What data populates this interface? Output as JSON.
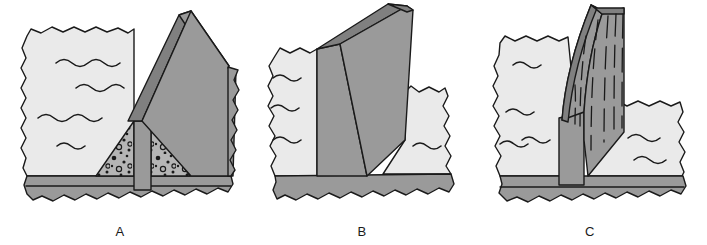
{
  "figure": {
    "background_color": "#ffffff",
    "width": 707,
    "height": 245
  },
  "palette": {
    "outline": "#1a1a1a",
    "light_rock": "#eaeaea",
    "medium_gray": "#9a9a9a",
    "dark_gray": "#808080",
    "basement_gray": "#9a9a9a",
    "stipple_fill": "#b5b5b5",
    "stipple_clast": "#1a1a1a",
    "white": "#ffffff"
  },
  "panels": [
    {
      "id": "A",
      "label": "A",
      "caption": "Fault scarp with wedge of talus and colluvial debris banked against the exposed fault plane",
      "features": [
        {
          "name": "light-bedded-rock-block",
          "fill": "#eaeaea",
          "symbol": "wavy-bedding-lines",
          "line_count": 4
        },
        {
          "name": "fault-plane-face",
          "fill": "#808080"
        },
        {
          "name": "uplifted-block-top",
          "fill": "#9a9a9a"
        },
        {
          "name": "uplifted-block-side",
          "fill": "#9a9a9a"
        },
        {
          "name": "talus-wedge-left",
          "fill": "#b5b5b5",
          "texture": "stippled-clasts"
        },
        {
          "name": "talus-wedge-right",
          "fill": "#b5b5b5",
          "texture": "stippled-clasts"
        },
        {
          "name": "central-pillar",
          "fill": "#9a9a9a"
        },
        {
          "name": "basement-layer",
          "fill": "#9a9a9a"
        }
      ]
    },
    {
      "id": "B",
      "label": "B",
      "caption": "Tilted fault block exposing a broad planar fault surface above the basement",
      "features": [
        {
          "name": "light-bedded-rock-block",
          "fill": "#eaeaea",
          "symbol": "wavy-bedding-lines",
          "line_count": 4
        },
        {
          "name": "fault-plane-face",
          "fill": "#9a9a9a"
        },
        {
          "name": "tilted-block-top",
          "fill": "#9a9a9a"
        },
        {
          "name": "tilted-block-front",
          "fill": "#9a9a9a"
        },
        {
          "name": "basement-layer",
          "fill": "#9a9a9a"
        }
      ]
    },
    {
      "id": "C",
      "label": "C",
      "caption": "Curved listric fault surface bearing vertical slickenside striations",
      "features": [
        {
          "name": "light-bedded-rock-block-left",
          "fill": "#eaeaea",
          "symbol": "wavy-bedding-lines",
          "line_count": 3
        },
        {
          "name": "light-bedded-rock-block-right",
          "fill": "#eaeaea",
          "symbol": "wavy-bedding-lines",
          "line_count": 3
        },
        {
          "name": "curved-fault-surface",
          "fill": "#9a9a9a"
        },
        {
          "name": "fault-surface-edge-band",
          "fill": "#808080"
        },
        {
          "name": "slickenside-striations",
          "style": "dashed-vertical-lines",
          "line_count": 6
        },
        {
          "name": "footwall-pillar",
          "fill": "#9a9a9a"
        },
        {
          "name": "basement-layer",
          "fill": "#9a9a9a"
        }
      ]
    }
  ]
}
